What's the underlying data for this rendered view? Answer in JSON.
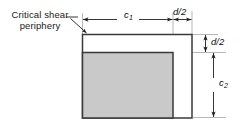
{
  "figure": {
    "name": "critical-shear-periphery-diagram",
    "background": "#ffffff",
    "callout": {
      "line1": "Critical shear",
      "line2": "periphery",
      "text": "Critical shear periphery"
    },
    "dimensions": {
      "c1": {
        "symbol": "c",
        "subscript": "1",
        "label": "c1",
        "orientation": "horizontal"
      },
      "d_over_2_top": {
        "label": "d/2",
        "orientation": "horizontal"
      },
      "d_over_2_right": {
        "label": "d/2",
        "orientation": "vertical"
      },
      "c2": {
        "symbol": "c",
        "subscript": "2",
        "label": "c2",
        "orientation": "vertical"
      }
    },
    "shapes": {
      "outer_rectangle": {
        "name": "critical-shear-perimeter-rect",
        "fill": "#ffffff",
        "stroke": "#3a3a3a",
        "x": 82,
        "y": 34,
        "width": 110,
        "height": 84
      },
      "inner_rectangle": {
        "name": "column-section-rect",
        "fill": "#c9c9c9",
        "stroke": "#3a3a3a",
        "x": 82,
        "y": 52,
        "width": 91,
        "height": 66
      }
    },
    "colors": {
      "line": "#3a3a3a",
      "dimension_line": "#1f1f1f",
      "extension_line": "#8f8f8f",
      "fill_gray": "#c9c9c9",
      "fill_white": "#ffffff",
      "text": "#1a1a1a"
    }
  }
}
